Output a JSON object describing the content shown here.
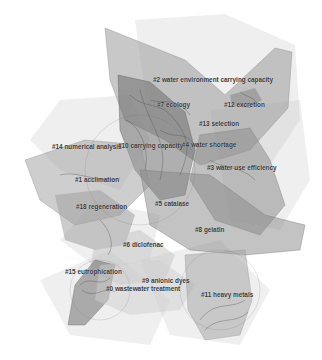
{
  "diagram": {
    "type": "cluster-network-map",
    "clusters": [
      {
        "id": "0",
        "label": "#0 wastewater treatment"
      },
      {
        "id": "1",
        "label": "#1 acclimation"
      },
      {
        "id": "2",
        "label": "#2 water environment carrying capacity"
      },
      {
        "id": "3",
        "label": "#3 water use efficiency"
      },
      {
        "id": "4",
        "label": "#4 water shortage"
      },
      {
        "id": "5",
        "label": "#5 catalase"
      },
      {
        "id": "6",
        "label": "#6 diclofenac"
      },
      {
        "id": "7",
        "label": "#7 ecology"
      },
      {
        "id": "8",
        "label": "#8 gelatin"
      },
      {
        "id": "9",
        "label": "#9 anionic dyes"
      },
      {
        "id": "10",
        "label": "#10 carrying capacity"
      },
      {
        "id": "11",
        "label": "#11 heavy metals"
      },
      {
        "id": "12",
        "label": "#12 excretion"
      },
      {
        "id": "13",
        "label": "#13 selection"
      },
      {
        "id": "14",
        "label": "#14 numerical analysis"
      },
      {
        "id": "15",
        "label": "#15 eutrophication"
      },
      {
        "id": "18",
        "label": "#18 regeneration"
      }
    ]
  }
}
